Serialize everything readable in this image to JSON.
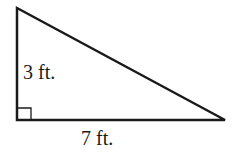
{
  "diagram": {
    "type": "right-triangle",
    "labels": {
      "height": "3 ft.",
      "base": "7 ft."
    },
    "colors": {
      "stroke": "#1a1a1a",
      "background": "#ffffff"
    }
  }
}
